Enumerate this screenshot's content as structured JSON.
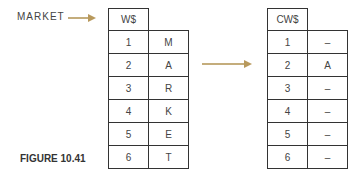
{
  "figure": {
    "caption": "FIGURE 10.41",
    "pointer_label": "MARKET",
    "arrow_color": "#c4ad7c"
  },
  "source_array": {
    "name": "W$",
    "rows": [
      {
        "index": "1",
        "value": "M"
      },
      {
        "index": "2",
        "value": "A"
      },
      {
        "index": "3",
        "value": "R"
      },
      {
        "index": "4",
        "value": "K"
      },
      {
        "index": "5",
        "value": "E"
      },
      {
        "index": "6",
        "value": "T"
      }
    ]
  },
  "target_array": {
    "name": "CW$",
    "rows": [
      {
        "index": "1",
        "value": "–"
      },
      {
        "index": "2",
        "value": "A"
      },
      {
        "index": "3",
        "value": "–"
      },
      {
        "index": "4",
        "value": "–"
      },
      {
        "index": "5",
        "value": "–"
      },
      {
        "index": "6",
        "value": "–"
      }
    ]
  }
}
